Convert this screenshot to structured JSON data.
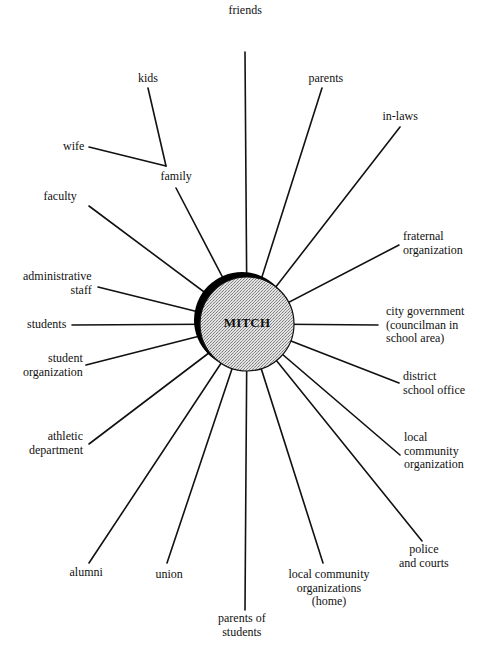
{
  "center": {
    "label": "MITCH",
    "cx": 247,
    "cy": 324,
    "r": 47,
    "shadow_cx": 242,
    "shadow_cy": 320,
    "shadow_r": 48,
    "fill_color": "#d8d8d8",
    "shadow_color": "#000000"
  },
  "colors": {
    "line": "#111111",
    "text": "#111111",
    "background": "#ffffff"
  },
  "nodes": [
    {
      "id": "friends",
      "lines": [
        "friends"
      ],
      "align": "center",
      "lx": 245,
      "ly": 4,
      "x1": 245,
      "y1": 52
    },
    {
      "id": "parents",
      "lines": [
        "parents"
      ],
      "align": "center",
      "lx": 326,
      "ly": 72,
      "x1": 322,
      "y1": 88
    },
    {
      "id": "in-laws",
      "lines": [
        "in-laws"
      ],
      "align": "center",
      "lx": 400,
      "ly": 110,
      "x1": 400,
      "y1": 127
    },
    {
      "id": "fraternal-organization",
      "lines": [
        "fraternal",
        "organization"
      ],
      "align": "left",
      "lx": 403,
      "ly": 230,
      "x1": 399,
      "y1": 245
    },
    {
      "id": "city-government",
      "lines": [
        "city government",
        "(councilman in",
        "school area)"
      ],
      "align": "left",
      "lx": 386,
      "ly": 305,
      "x1": 378,
      "y1": 325
    },
    {
      "id": "district-school-office",
      "lines": [
        "district",
        "school office"
      ],
      "align": "left",
      "lx": 403,
      "ly": 370,
      "x1": 399,
      "y1": 383
    },
    {
      "id": "local-community-organization",
      "lines": [
        "local",
        "community",
        "organization"
      ],
      "align": "left",
      "lx": 404,
      "ly": 431,
      "x1": 400,
      "y1": 455
    },
    {
      "id": "police-and-courts",
      "lines": [
        "police",
        "and courts"
      ],
      "align": "center",
      "lx": 424,
      "ly": 543,
      "x1": 422,
      "y1": 541
    },
    {
      "id": "local-community-organizations-home",
      "lines": [
        "local community",
        "organizations",
        "(home)"
      ],
      "align": "center",
      "lx": 329,
      "ly": 568,
      "x1": 323,
      "y1": 563
    },
    {
      "id": "parents-of-students",
      "lines": [
        "parents of",
        "students"
      ],
      "align": "center",
      "lx": 242,
      "ly": 612,
      "x1": 245,
      "y1": 610
    },
    {
      "id": "union",
      "lines": [
        "union"
      ],
      "align": "center",
      "lx": 169,
      "ly": 568,
      "x1": 167,
      "y1": 563
    },
    {
      "id": "alumni",
      "lines": [
        "alumni"
      ],
      "align": "center",
      "lx": 86,
      "ly": 566,
      "x1": 89,
      "y1": 563
    },
    {
      "id": "athletic-department",
      "lines": [
        "athletic",
        "department"
      ],
      "align": "right",
      "lx": 83,
      "ly": 430,
      "x1": 89,
      "y1": 444
    },
    {
      "id": "student-organization",
      "lines": [
        "student",
        "organization"
      ],
      "align": "right",
      "lx": 83,
      "ly": 352,
      "x1": 86,
      "y1": 365
    },
    {
      "id": "students",
      "lines": [
        "students"
      ],
      "align": "right",
      "lx": 66,
      "ly": 318,
      "x1": 72,
      "y1": 325
    },
    {
      "id": "administrative-staff",
      "lines": [
        "administrative",
        "staff"
      ],
      "align": "right",
      "lx": 92,
      "ly": 270,
      "x1": 98,
      "y1": 287
    },
    {
      "id": "faculty",
      "lines": [
        "faculty"
      ],
      "align": "center",
      "lx": 60,
      "ly": 190,
      "x1": 89,
      "y1": 206
    },
    {
      "id": "family",
      "lines": [
        "family"
      ],
      "align": "center",
      "lx": 176,
      "ly": 170,
      "x1": 176,
      "y1": 188
    }
  ],
  "family_branch": {
    "junction": {
      "x": 166,
      "y": 166
    },
    "children": [
      {
        "id": "kids",
        "lines": [
          "kids"
        ],
        "align": "center",
        "lx": 148,
        "ly": 72,
        "x": 148,
        "y": 88
      },
      {
        "id": "wife",
        "lines": [
          "wife"
        ],
        "align": "right",
        "lx": 84,
        "ly": 140,
        "x": 89,
        "y": 147
      }
    ]
  }
}
